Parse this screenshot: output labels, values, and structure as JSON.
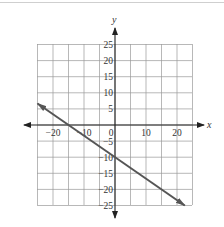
{
  "chart_data": {
    "type": "line",
    "title": "",
    "xlabel": "x",
    "ylabel": "y",
    "xlim": [
      -25,
      25
    ],
    "ylim": [
      -25,
      25
    ],
    "grid": true,
    "grid_step": 5,
    "x_ticks": [
      {
        "value": -20,
        "label": "−20"
      },
      {
        "value": -10,
        "label": "−10"
      },
      {
        "value": 0,
        "label": "0"
      },
      {
        "value": 10,
        "label": "10"
      },
      {
        "value": 20,
        "label": "20"
      }
    ],
    "y_ticks": [
      {
        "value": 25,
        "label": "25"
      },
      {
        "value": 20,
        "label": "20"
      },
      {
        "value": 15,
        "label": "15"
      },
      {
        "value": 10,
        "label": "10"
      },
      {
        "value": 5,
        "label": "5"
      },
      {
        "value": -5,
        "label": "−5"
      },
      {
        "value": -10,
        "label": "−10"
      },
      {
        "value": -15,
        "label": "−15"
      },
      {
        "value": -20,
        "label": "−20"
      },
      {
        "value": -25,
        "label": "−25"
      }
    ],
    "series": [
      {
        "name": "line",
        "equation": "y = -2/3 x - 10",
        "x": [
          -25,
          22.5
        ],
        "y": [
          6.67,
          -25
        ],
        "color": "#555555",
        "arrows": "both"
      }
    ]
  },
  "labels": {
    "x_axis": "x",
    "y_axis": "y"
  }
}
